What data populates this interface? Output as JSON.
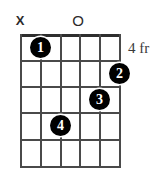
{
  "diagram": {
    "type": "guitar-chord-diagram",
    "strings": 6,
    "frets": 5,
    "base_fret_label": "4 fr",
    "grid": {
      "left": 20,
      "top": 34,
      "right": 119,
      "bottom": 166,
      "string_x": [
        20,
        40,
        60,
        79,
        99,
        119
      ],
      "fret_y": [
        34,
        60,
        86,
        112,
        139,
        166
      ],
      "line_color": "#4a4a4a",
      "nut_color": "#2e2e2e"
    },
    "string_markers": [
      {
        "symbol": "X",
        "string_index": 0,
        "x": 20,
        "y": 21,
        "name": "muted-string-marker"
      },
      {
        "symbol": "O",
        "string_index": 3,
        "x": 78,
        "y": 21,
        "name": "open-string-marker"
      }
    ],
    "finger_dots": [
      {
        "label": "1",
        "string_index": 1,
        "fret": 1,
        "x": 40,
        "y": 47
      },
      {
        "label": "2",
        "string_index": 5,
        "fret": 2,
        "x": 119,
        "y": 73
      },
      {
        "label": "3",
        "string_index": 4,
        "fret": 3,
        "x": 99,
        "y": 99
      },
      {
        "label": "4",
        "string_index": 2,
        "fret": 4,
        "x": 60,
        "y": 125
      }
    ],
    "fret_label_position": {
      "x": 128,
      "y": 40
    },
    "dot_color": "#000000",
    "dot_text_color": "#ffffff",
    "background": "#ffffff"
  }
}
